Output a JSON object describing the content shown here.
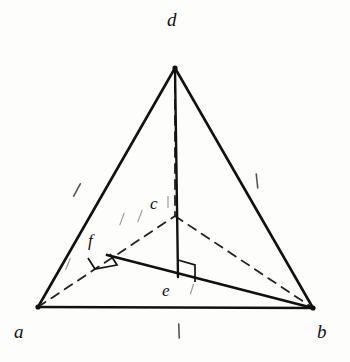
{
  "figure": {
    "kind": "geometry-diagram",
    "background_color": "#fdfdfc",
    "ink_color": "#111111",
    "faint_ink_color": "#9a9a9a"
  },
  "vertices": [
    {
      "id": "a",
      "label": "a",
      "x": 38,
      "y": 307,
      "label_x": 14,
      "label_y": 322
    },
    {
      "id": "b",
      "label": "b",
      "x": 313,
      "y": 308,
      "label_x": 317,
      "label_y": 322
    },
    {
      "id": "c",
      "label": "c",
      "x": 175,
      "y": 216,
      "label_x": 150,
      "label_y": 195
    },
    {
      "id": "d",
      "label": "d",
      "x": 175,
      "y": 68,
      "label_x": 167,
      "label_y": 10
    },
    {
      "id": "e",
      "label": "e",
      "x": 178,
      "y": 277,
      "label_x": 162,
      "label_y": 282
    },
    {
      "id": "f",
      "label": "f",
      "x": 107,
      "y": 255,
      "label_x": 88,
      "label_y": 232
    }
  ],
  "edges": [
    {
      "id": "ab",
      "from": "a",
      "to": "b",
      "style": "solid",
      "width": 2.6,
      "name": "edge-a-b"
    },
    {
      "id": "ad",
      "from": "a",
      "to": "d",
      "style": "solid",
      "width": 2.6,
      "name": "edge-a-d"
    },
    {
      "id": "bd",
      "from": "b",
      "to": "d",
      "style": "solid",
      "width": 2.6,
      "name": "edge-b-d"
    },
    {
      "id": "ac",
      "from": "a",
      "to": "c",
      "style": "dashed",
      "width": 1.8,
      "name": "edge-a-c"
    },
    {
      "id": "cb",
      "from": "c",
      "to": "b",
      "style": "dashed",
      "width": 1.8,
      "name": "edge-c-b"
    },
    {
      "id": "dc",
      "from": "d",
      "to": "c",
      "style": "dashed",
      "width": 1.8,
      "name": "edge-d-c"
    },
    {
      "id": "de",
      "from": "d",
      "to": "e",
      "style": "solid",
      "width": 2.4,
      "name": "segment-d-e"
    },
    {
      "id": "fb",
      "from": "f",
      "to": "b",
      "style": "solid",
      "width": 2.8,
      "name": "segment-f-b"
    }
  ],
  "right_angle_marks": [
    {
      "id": "angle-at-e",
      "name": "right-angle-mark-e",
      "cx": 178,
      "cy": 277,
      "size": 17,
      "orientation": "vertical-on-fb"
    },
    {
      "id": "angle-at-f",
      "name": "right-angle-mark-f",
      "cx": 107,
      "cy": 255,
      "size": 16,
      "orientation": "skew-on-ac"
    }
  ],
  "tick_marks": [
    {
      "id": "tick-ad",
      "name": "tick-mark-edge-a-d",
      "x": 77,
      "y": 190,
      "angle": -28,
      "length": 14,
      "faint": false
    },
    {
      "id": "tick-bd",
      "name": "tick-mark-edge-b-d",
      "x": 257,
      "y": 181,
      "angle": 6,
      "length": 14,
      "faint": false
    },
    {
      "id": "tick-ab",
      "name": "tick-mark-edge-a-b",
      "x": 179,
      "y": 331,
      "angle": 2,
      "length": 14,
      "faint": false
    },
    {
      "id": "tick-ac-1",
      "name": "tick-mark-edge-a-c-inner",
      "x": 122,
      "y": 219,
      "angle": -20,
      "length": 12,
      "faint": true
    },
    {
      "id": "tick-ac-2",
      "name": "tick-mark-edge-a-c-outer",
      "x": 140,
      "y": 216,
      "angle": -20,
      "length": 12,
      "faint": true
    },
    {
      "id": "tick-af-1",
      "name": "tick-mark-segment-a-f",
      "x": 68,
      "y": 264,
      "angle": -22,
      "length": 12,
      "faint": true
    },
    {
      "id": "tick-ce",
      "name": "tick-mark-near-c",
      "x": 168,
      "y": 202,
      "angle": 0,
      "length": 11,
      "faint": true
    },
    {
      "id": "tick-eb",
      "name": "tick-mark-near-e",
      "x": 192,
      "y": 289,
      "angle": -18,
      "length": 10,
      "faint": true
    }
  ],
  "caption": {
    "visible": false,
    "text": ""
  }
}
